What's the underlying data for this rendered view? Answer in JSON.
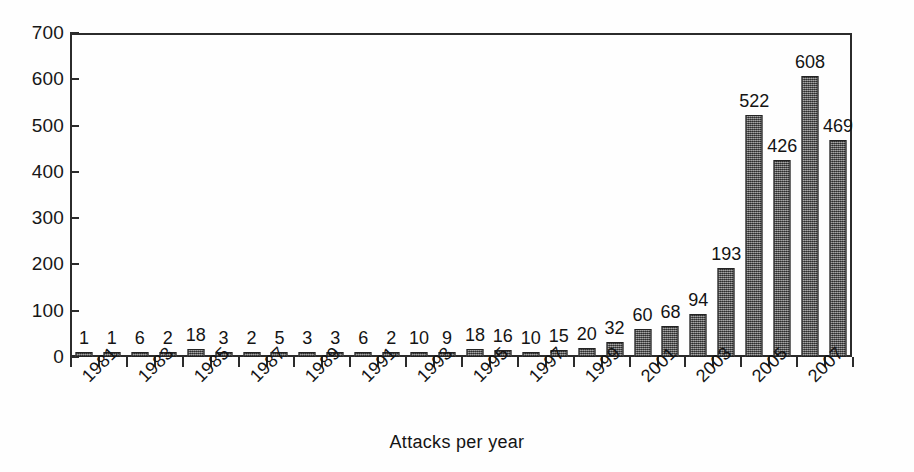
{
  "chart_data": {
    "type": "bar",
    "title": "",
    "subtitle": "",
    "xlabel": "Attacks per year",
    "ylabel": "",
    "grid": false,
    "legend": false,
    "ylim": [
      0,
      700
    ],
    "ytick_step": 100,
    "yticks": [
      "0",
      "100",
      "200",
      "300",
      "400",
      "500",
      "600",
      "700"
    ],
    "categories": [
      "1981",
      "1982",
      "1983",
      "1984",
      "1985",
      "1986",
      "1987",
      "1988",
      "1989",
      "1990",
      "1991",
      "1992",
      "1993",
      "1994",
      "1995",
      "1996",
      "1997",
      "1998",
      "1999",
      "2000",
      "2001",
      "2002",
      "2003",
      "2004",
      "2005",
      "2006",
      "2007",
      "2008"
    ],
    "tick_labels_shown": [
      "1981",
      "",
      "1983",
      "",
      "1985",
      "",
      "1987",
      "",
      "1989",
      "",
      "1991",
      "",
      "1993",
      "",
      "1995",
      "",
      "1997",
      "",
      "1999",
      "",
      "2001",
      "",
      "2003",
      "",
      "2005",
      "",
      "2007",
      ""
    ],
    "values": [
      1,
      1,
      6,
      2,
      18,
      3,
      2,
      5,
      3,
      3,
      6,
      2,
      10,
      9,
      18,
      16,
      10,
      15,
      20,
      32,
      60,
      68,
      94,
      193,
      522,
      426,
      608,
      469
    ],
    "value_labels": [
      "1",
      "1",
      "6",
      "2",
      "18",
      "3",
      "2",
      "5",
      "3",
      "3",
      "6",
      "2",
      "10",
      "9",
      "18",
      "16",
      "10",
      "15",
      "20",
      "32",
      "60",
      "68",
      "94",
      "193",
      "522",
      "426",
      "608",
      "469"
    ],
    "bar_fill_color": "#6e6e6e",
    "bar_edge_color": "#232323",
    "axis_color": "#2b2b2b",
    "background_color": "#fefefe"
  }
}
